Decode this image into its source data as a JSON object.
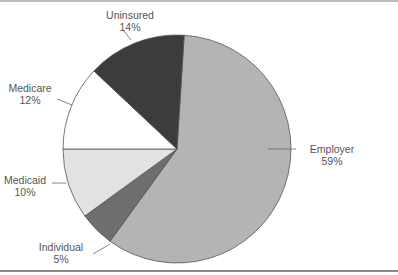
{
  "chart_data": {
    "type": "pie",
    "title": "",
    "start_angle_deg": 3.6,
    "direction": "clockwise",
    "slices": [
      {
        "label": "Employer",
        "value": 59,
        "pct_label": "59%",
        "color": "#b4b4b4"
      },
      {
        "label": "Individual",
        "value": 5,
        "pct_label": "5%",
        "color": "#6e6e6e"
      },
      {
        "label": "Medicaid",
        "value": 10,
        "pct_label": "10%",
        "color": "#e2e2e2"
      },
      {
        "label": "Medicare",
        "value": 12,
        "pct_label": "12%",
        "color": "#ffffff"
      },
      {
        "label": "Uninsured",
        "value": 14,
        "pct_label": "14%",
        "color": "#3c3c3c"
      }
    ]
  }
}
